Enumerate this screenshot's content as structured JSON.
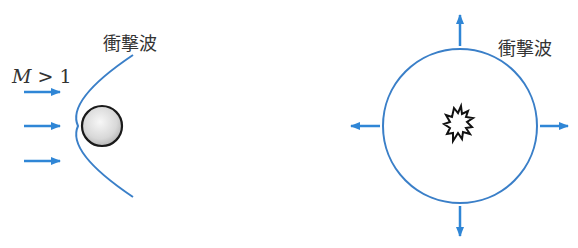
{
  "left_panel": {
    "shock_label": "衝撃波",
    "mach_symbol": "M",
    "mach_relation": " > 1",
    "flow_arrows": 3,
    "object": "sphere",
    "wave": "bow-shock"
  },
  "right_panel": {
    "shock_label": "衝撃波",
    "source": "explosion",
    "wave": "spherical-shock",
    "arrows": [
      "up",
      "right",
      "down",
      "left"
    ]
  },
  "colors": {
    "wave": "#3a7fc8",
    "arrow": "#2f86d6",
    "text": "#333333",
    "sphere_edge": "#1a1a1a",
    "sphere_fill": "#dcdcdc"
  }
}
